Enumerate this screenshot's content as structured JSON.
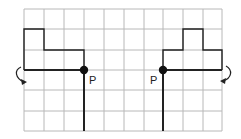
{
  "diagram": {
    "grid": {
      "columns": 10,
      "rows": 6,
      "origin_x": 24,
      "origin_y": 9,
      "cell_w": 19.8,
      "cell_h": 20.3,
      "line_color": "#b5b5b5"
    },
    "stroke_color": "#222222",
    "left_figure": {
      "pivot_label": "P",
      "rotation_arrow": "counterclockwise"
    },
    "right_figure": {
      "pivot_label": "P",
      "rotation_arrow": "clockwise"
    }
  }
}
